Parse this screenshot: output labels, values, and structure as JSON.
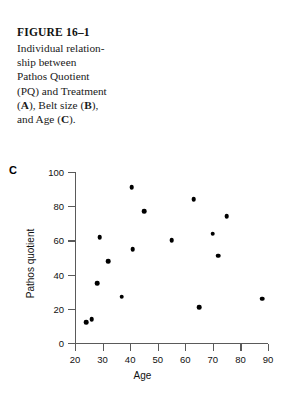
{
  "figure": {
    "number_label": "FIGURE 16–1",
    "caption_lines": [
      "Individual relation-",
      "ship between",
      "Pathos Quotient",
      "(PQ) and Treatment"
    ],
    "caption_line_5_a": "(",
    "caption_line_5_b": "A",
    "caption_line_5_c": "), Belt size (",
    "caption_line_5_d": "B",
    "caption_line_5_e": "),",
    "caption_line_6_a": "and Age (",
    "caption_line_6_b": "C",
    "caption_line_6_c": ")."
  },
  "panel": {
    "label": "C"
  },
  "colors": {
    "marker": "#000000",
    "axis": "#5a5a5a",
    "text": "#111111",
    "background": "#ffffff"
  },
  "chart_data": {
    "type": "scatter",
    "title": "",
    "xlabel": "Age",
    "ylabel": "Pathos quotient",
    "xlim": [
      20,
      90
    ],
    "ylim": [
      0,
      100
    ],
    "xticks": [
      20,
      30,
      40,
      50,
      60,
      70,
      80,
      90
    ],
    "yticks": [
      0,
      20,
      40,
      60,
      80,
      100
    ],
    "grid": false,
    "legend": false,
    "x": [
      24,
      26,
      28,
      29,
      32,
      37,
      40.5,
      41,
      45,
      55,
      63,
      65,
      70,
      72,
      75,
      88
    ],
    "y": [
      12,
      14,
      35,
      62,
      48,
      27,
      91,
      55,
      77,
      60,
      84,
      21,
      64,
      51,
      74,
      26
    ]
  }
}
